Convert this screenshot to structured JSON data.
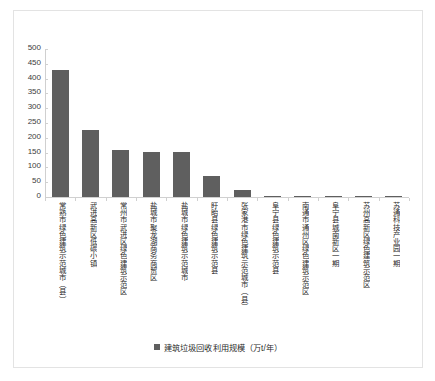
{
  "chart_data": {
    "type": "bar",
    "title": "",
    "xlabel": "",
    "ylabel": "",
    "ylim": [
      0,
      500
    ],
    "ytick_step": 50,
    "yticks": [
      "500",
      "450",
      "400",
      "350",
      "300",
      "250",
      "200",
      "150",
      "100",
      "50",
      "0"
    ],
    "grid": false,
    "legend_position": "bottom-center",
    "series": [
      {
        "name": "建筑垃圾回收利用规模（万t/年）",
        "color": "#5f5f5f",
        "values": [
          430,
          228,
          158,
          152,
          152,
          70,
          25,
          5,
          4,
          5,
          4,
          4
        ]
      }
    ],
    "categories": [
      "常熟市绿色建筑示范城市（县）",
      "武进高新区低碳小镇",
      "常州市武进区绿色建筑示范区",
      "盐城市聚龙湖商务商贸区",
      "盐城市绿色建筑示范城市",
      "盱眙县绿色建筑示范县",
      "张家港市绿色建筑示范城市（县）",
      "阜宁县绿色建筑示范县",
      "南通市通州区绿色建筑示范区",
      "阜宁县城南新区一期",
      "苏州高新区绿色建筑示范区",
      "苏通科技产业园一期"
    ]
  },
  "legend": {
    "label": "建筑垃圾回收利用规模（万t/年）"
  },
  "colors": {
    "bar": "#5f5f5f",
    "axis": "#d0d0d0",
    "frame": "#e3e3e3",
    "text": "#2b2b2b"
  }
}
